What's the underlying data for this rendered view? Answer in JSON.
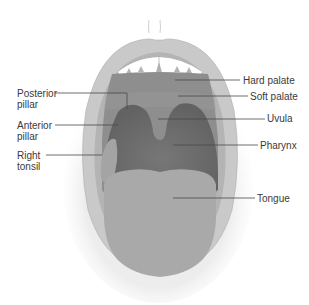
{
  "diagram": {
    "colors": {
      "lip_outer": "#c9c9c9",
      "lip_inner": "#b4b4b4",
      "palate": "#8e8e8e",
      "soft_palate_band": "#9a9a9a",
      "pharynx": "#6c6c6c",
      "tonsil": "#a6a6a6",
      "tongue": "#a9a9a9",
      "teeth": "#ffffff",
      "leader_line": "#4a4a4a",
      "text": "#3a3a3a"
    },
    "labels_left": [
      {
        "id": "posterior-pillar",
        "text": "Posterior\npillar"
      },
      {
        "id": "anterior-pillar",
        "text": "Anterior\npillar"
      },
      {
        "id": "right-tonsil",
        "text": "Right\ntonsil"
      }
    ],
    "labels_right": [
      {
        "id": "hard-palate",
        "text": "Hard palate"
      },
      {
        "id": "soft-palate",
        "text": "Soft palate"
      },
      {
        "id": "uvula",
        "text": "Uvula"
      },
      {
        "id": "pharynx",
        "text": "Pharynx"
      },
      {
        "id": "tongue",
        "text": "Tongue"
      }
    ]
  }
}
